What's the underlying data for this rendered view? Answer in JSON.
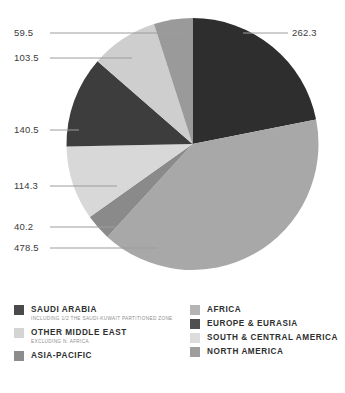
{
  "chart_data": {
    "type": "pie",
    "title": "",
    "subtitle": "",
    "xlabel": "",
    "ylabel": "",
    "legend_position": "bottom",
    "grid": false,
    "total": 1198.8,
    "categories": [
      "Saudi Arabia",
      "Other Middle East",
      "Asia-Pacific",
      "Africa",
      "Europe & Eurasia",
      "South & Central America",
      "North America"
    ],
    "slices": [
      {
        "label": "262.3",
        "value": 262.3,
        "color": "#2e2e2e",
        "category": "Saudi Arabia",
        "start_angle": 0.0,
        "end_angle": 78.8
      },
      {
        "label": "478.5",
        "value": 478.5,
        "color": "#a8a8a8",
        "category": "South & Central America",
        "start_angle": 78.8,
        "end_angle": 222.5
      },
      {
        "label": "40.2",
        "value": 40.2,
        "color": "#8a8a8a",
        "category": "North America",
        "start_angle": 222.5,
        "end_angle": 234.6
      },
      {
        "label": "114.3",
        "value": 114.3,
        "color": "#d8d8d8",
        "category": "Other Middle East",
        "start_angle": 234.6,
        "end_angle": 268.9
      },
      {
        "label": "140.5",
        "value": 140.5,
        "color": "#3d3d3d",
        "category": "Africa",
        "start_angle": 268.9,
        "end_angle": 311.1
      },
      {
        "label": "103.5",
        "value": 103.5,
        "color": "#cecece",
        "category": "Europe & Eurasia",
        "start_angle": 311.1,
        "end_angle": 342.2
      },
      {
        "label": "59.5",
        "value": 59.5,
        "color": "#9a9a9a",
        "category": "Asia-Pacific",
        "start_angle": 342.2,
        "end_angle": 360.0
      }
    ],
    "values": [
      262.3,
      478.5,
      40.2,
      114.3,
      140.5,
      103.5,
      59.5
    ],
    "value_labels": [
      "262.3",
      "478.5",
      "40.2",
      "114.3",
      "140.5",
      "103.5",
      "59.5"
    ]
  },
  "labels": {
    "v_262_3": "262.3",
    "v_59_5": "59.5",
    "v_103_5": "103.5",
    "v_140_5": "140.5",
    "v_114_3": "114.3",
    "v_40_2": "40.2",
    "v_478_5": "478.5"
  },
  "legend": {
    "left": [
      {
        "label": "SAUDI ARABIA",
        "sub": "INCLUDING 1/2 THE SAUDI-KUWAIT PARTITIONED ZONE",
        "color": "#4a4a4a"
      },
      {
        "label": "OTHER MIDDLE EAST",
        "sub": "EXCLUDING N. AFRICA",
        "color": "#d4d4d4"
      },
      {
        "label": "ASIA-PACIFIC",
        "sub": "",
        "color": "#8c8c8c"
      }
    ],
    "right": [
      {
        "label": "AFRICA",
        "sub": "",
        "color": "#b4b4b4"
      },
      {
        "label": "EUROPE & EURASIA",
        "sub": "",
        "color": "#4f4f4f"
      },
      {
        "label": "SOUTH & CENTRAL AMERICA",
        "sub": "",
        "color": "#dcdcdc"
      },
      {
        "label": "NORTH AMERICA",
        "sub": "",
        "color": "#9e9e9e"
      }
    ]
  },
  "colors": {
    "leader_line": "#9c9c9c",
    "text": "#3b3b3b",
    "legend_text": "#2f2f2f",
    "legend_sub_text": "#8e8e8e",
    "background": "#ffffff"
  }
}
